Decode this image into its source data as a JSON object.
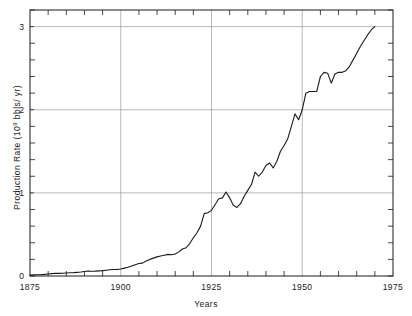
{
  "figure": {
    "y_axis_title_prefix": "Production Rate  (10",
    "y_axis_title_exponent": "9",
    "y_axis_title_suffix": " bbls/ yr)",
    "x_axis_title": "Years"
  },
  "chart_data": {
    "type": "line",
    "title": "",
    "xlabel": "Years",
    "ylabel": "Production Rate (10^9 bbls/yr)",
    "xlim": [
      1875,
      1975
    ],
    "ylim": [
      0,
      3.2
    ],
    "xticks": [
      1875,
      1900,
      1925,
      1950,
      1975
    ],
    "xtick_labels": [
      "1875",
      "1900",
      "1925",
      "1950",
      "1975"
    ],
    "yticks": [
      0,
      1,
      2,
      3
    ],
    "ytick_labels": [
      "0",
      "1",
      "2",
      "3"
    ],
    "x_minor_tick_step": 5,
    "y_minor_tick_step": 0.2,
    "grid": true,
    "gridlines_x": [
      1900,
      1925,
      1950
    ],
    "gridlines_y": [
      1,
      2,
      3
    ],
    "legend": null,
    "line_color": "#1a1a1a",
    "line_width": 1.1,
    "series": [
      {
        "name": "World crude oil production",
        "x": [
          1875,
          1876,
          1877,
          1878,
          1879,
          1880,
          1881,
          1882,
          1883,
          1884,
          1885,
          1886,
          1887,
          1888,
          1889,
          1890,
          1891,
          1892,
          1893,
          1894,
          1895,
          1896,
          1897,
          1898,
          1899,
          1900,
          1901,
          1902,
          1903,
          1904,
          1905,
          1906,
          1907,
          1908,
          1909,
          1910,
          1911,
          1912,
          1913,
          1914,
          1915,
          1916,
          1917,
          1918,
          1919,
          1920,
          1921,
          1922,
          1923,
          1924,
          1925,
          1926,
          1927,
          1928,
          1929,
          1930,
          1931,
          1932,
          1933,
          1934,
          1935,
          1936,
          1937,
          1938,
          1939,
          1940,
          1941,
          1942,
          1943,
          1944,
          1945,
          1946,
          1947,
          1948,
          1949,
          1950,
          1951,
          1952,
          1953,
          1954,
          1955,
          1956,
          1957,
          1958,
          1959,
          1960,
          1961,
          1962,
          1963,
          1964,
          1965,
          1966,
          1967,
          1968,
          1969,
          1970
        ],
        "values": [
          0.011,
          0.013,
          0.015,
          0.017,
          0.02,
          0.024,
          0.028,
          0.033,
          0.031,
          0.033,
          0.036,
          0.04,
          0.041,
          0.044,
          0.048,
          0.054,
          0.06,
          0.058,
          0.059,
          0.062,
          0.065,
          0.07,
          0.075,
          0.078,
          0.08,
          0.085,
          0.095,
          0.105,
          0.12,
          0.135,
          0.15,
          0.155,
          0.18,
          0.2,
          0.215,
          0.23,
          0.24,
          0.25,
          0.26,
          0.255,
          0.265,
          0.29,
          0.325,
          0.34,
          0.39,
          0.46,
          0.52,
          0.6,
          0.75,
          0.76,
          0.79,
          0.86,
          0.93,
          0.94,
          1.01,
          0.94,
          0.85,
          0.825,
          0.87,
          0.96,
          1.03,
          1.1,
          1.25,
          1.2,
          1.25,
          1.33,
          1.36,
          1.3,
          1.38,
          1.5,
          1.57,
          1.65,
          1.8,
          1.95,
          1.88,
          2.0,
          2.2,
          2.22,
          2.22,
          2.22,
          2.4,
          2.45,
          2.44,
          2.32,
          2.43,
          2.45,
          2.45,
          2.47,
          2.52,
          2.6,
          2.68,
          2.76,
          2.83,
          2.9,
          2.96,
          3.0
        ]
      }
    ]
  }
}
